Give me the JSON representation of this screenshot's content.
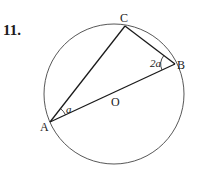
{
  "problem": {
    "number": "11."
  },
  "diagram": {
    "circle": {
      "cx": 114,
      "cy": 94,
      "r": 70,
      "stroke": "#444444"
    },
    "points": {
      "A": {
        "label": "A",
        "x": 50,
        "y": 122
      },
      "B": {
        "label": "B",
        "x": 175,
        "y": 64
      },
      "C": {
        "label": "C",
        "x": 125,
        "y": 26
      },
      "O": {
        "label": "O",
        "x": 114,
        "y": 94
      }
    },
    "segments": [
      {
        "from": "A",
        "to": "C"
      },
      {
        "from": "C",
        "to": "B"
      },
      {
        "from": "A",
        "to": "B"
      }
    ],
    "angles": {
      "at_A": {
        "label": "a"
      },
      "at_B": {
        "label": "2a"
      }
    },
    "line_color": "#1a1a1a"
  }
}
